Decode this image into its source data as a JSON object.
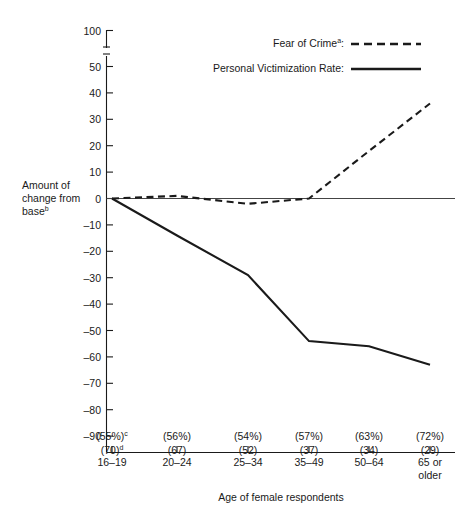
{
  "chart_data": {
    "type": "line",
    "title": "",
    "xlabel": "Age of female respondents",
    "ylabel": "Amount of change from base",
    "ylabel_superscript": "b",
    "categories": [
      "16–19",
      "20–24",
      "25–34",
      "35–49",
      "50–64",
      "65 or\nolder"
    ],
    "category_labels": [
      {
        "line1": "16–19",
        "line2": ""
      },
      {
        "line1": "20–24",
        "line2": ""
      },
      {
        "line1": "25–34",
        "line2": ""
      },
      {
        "line1": "35–49",
        "line2": ""
      },
      {
        "line1": "50–64",
        "line2": ""
      },
      {
        "line1": "65 or",
        "line2": "older"
      }
    ],
    "ytick_labels": [
      "100",
      "50",
      "40",
      "30",
      "20",
      "10",
      "0",
      "–10",
      "–20",
      "–30",
      "–40",
      "–50",
      "–60",
      "–70",
      "–80",
      "–90"
    ],
    "ytick_values": [
      100,
      50,
      40,
      30,
      20,
      10,
      0,
      -10,
      -20,
      -30,
      -40,
      -50,
      -60,
      -70,
      -80,
      -90
    ],
    "axis_break": true,
    "axis_break_note": "y-axis broken between 50 and 100",
    "ylim": [
      -90,
      100
    ],
    "grid": false,
    "legend_position": "top-right",
    "series": [
      {
        "name": "Fear of Crime",
        "name_superscript": "a",
        "style": "dashed",
        "values": [
          0,
          1,
          -2,
          0,
          18,
          36
        ]
      },
      {
        "name": "Personal Victimization Rate",
        "name_superscript": "",
        "style": "solid",
        "values": [
          0,
          -14,
          -29,
          -54,
          -56,
          -63
        ]
      }
    ],
    "annotations": {
      "percent_row": [
        "(55%)",
        "(56%)",
        "(54%)",
        "(57%)",
        "(63%)",
        "(72%)"
      ],
      "percent_row_superscript": "c",
      "rate_row": [
        "(70)",
        "(67)",
        "(52)",
        "(37)",
        "(34)",
        "(29)"
      ],
      "rate_row_superscript": "d"
    }
  },
  "legend": {
    "items": [
      {
        "label": "Fear of Crime",
        "superscript": "a",
        "suffix": ":",
        "style": "dashed"
      },
      {
        "label": "Personal Victimization Rate",
        "superscript": "",
        "suffix": ":",
        "style": "solid"
      }
    ]
  }
}
